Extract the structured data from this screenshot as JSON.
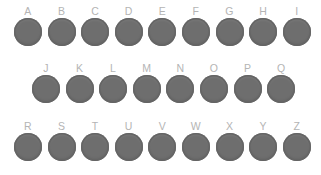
{
  "diagram": {
    "background_color": "#ffffff",
    "key_color": "#6e6e6e",
    "key_edge_color": "#656565",
    "label_color": "#b4b4b4",
    "key_diameter_px": 28,
    "rows": [
      {
        "name": "row-top",
        "indent_px": 14,
        "keys": [
          {
            "label": "A"
          },
          {
            "label": "B"
          },
          {
            "label": "C"
          },
          {
            "label": "D"
          },
          {
            "label": "E"
          },
          {
            "label": "F"
          },
          {
            "label": "G"
          },
          {
            "label": "H"
          },
          {
            "label": "I"
          }
        ]
      },
      {
        "name": "row-middle",
        "indent_px": 32,
        "keys": [
          {
            "label": "J"
          },
          {
            "label": "K"
          },
          {
            "label": "L"
          },
          {
            "label": "M"
          },
          {
            "label": "N"
          },
          {
            "label": "O"
          },
          {
            "label": "P"
          },
          {
            "label": "Q"
          }
        ]
      },
      {
        "name": "row-bottom",
        "indent_px": 14,
        "keys": [
          {
            "label": "R"
          },
          {
            "label": "S"
          },
          {
            "label": "T"
          },
          {
            "label": "U"
          },
          {
            "label": "V"
          },
          {
            "label": "W"
          },
          {
            "label": "X"
          },
          {
            "label": "Y"
          },
          {
            "label": "Z"
          }
        ]
      }
    ]
  }
}
